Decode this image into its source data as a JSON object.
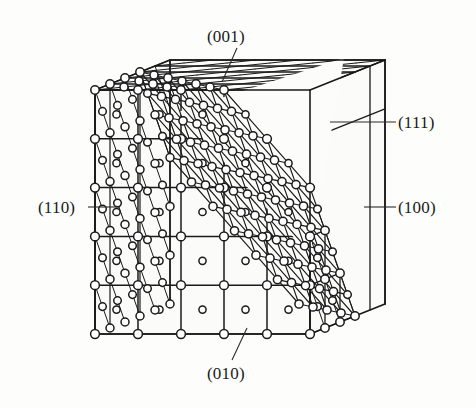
{
  "figure": {
    "background_color": "#fdfdfc",
    "line_color": "#1a1a1a",
    "atom_fill_color": "#ffffff",
    "atom_stroke_color": "#1a1a1a"
  },
  "labels": {
    "top": "(001)",
    "bottom": "(010)",
    "left": "(110)",
    "right": "(100)",
    "diagonal": "(111)"
  },
  "chart_data": {
    "type": "diagram",
    "grid_divisions": 5,
    "planes": [
      {
        "index": "(001)",
        "position": "top face",
        "label_x": 232,
        "label_y": 36,
        "leader_from": [
          237,
          48
        ],
        "leader_to": [
          222,
          82
        ]
      },
      {
        "index": "(010)",
        "position": "front face",
        "label_x": 232,
        "label_y": 373,
        "leader_from": [
          232,
          360
        ],
        "leader_to": [
          247,
          328
        ]
      },
      {
        "index": "(110)",
        "position": "left face",
        "label_x": 63,
        "label_y": 207,
        "leader_from": [
          88,
          207
        ],
        "leader_to": [
          120,
          207
        ]
      },
      {
        "index": "(100)",
        "position": "right face",
        "label_x": 423,
        "label_y": 207,
        "leader_from": [
          396,
          207
        ],
        "leader_to": [
          364,
          207
        ]
      },
      {
        "index": "(111)",
        "position": "cut corner",
        "label_x": 423,
        "label_y": 122,
        "leader_from": [
          396,
          122
        ],
        "leader_to": [
          330,
          122
        ]
      }
    ],
    "geometry": {
      "front_top_left": [
        95,
        90
      ],
      "front_top_right": [
        310,
        90
      ],
      "front_bottom_left": [
        95,
        334
      ],
      "front_bottom_right": [
        310,
        334
      ],
      "depth_offset": [
        75,
        -30
      ],
      "cut_vertices": [
        [
          178,
          112
        ],
        [
          310,
          255
        ],
        [
          344,
          58
        ]
      ]
    }
  }
}
